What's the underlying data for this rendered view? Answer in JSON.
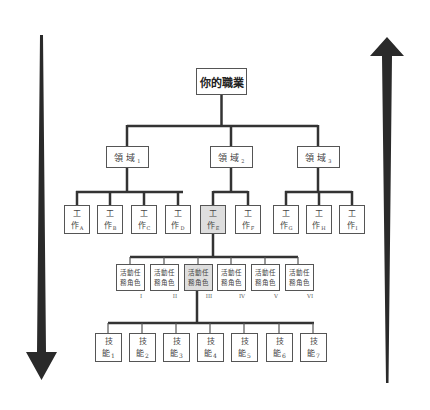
{
  "diagram": {
    "root": {
      "label": "你的職業"
    },
    "domains": [
      {
        "label": "領 域",
        "sub": "1"
      },
      {
        "label": "領 域",
        "sub": "2"
      },
      {
        "label": "領 域",
        "sub": "3"
      }
    ],
    "jobs": [
      {
        "line1": "工",
        "line2": "作",
        "sub": "A",
        "highlighted": false
      },
      {
        "line1": "工",
        "line2": "作",
        "sub": "B",
        "highlighted": false
      },
      {
        "line1": "工",
        "line2": "作",
        "sub": "C",
        "highlighted": false
      },
      {
        "line1": "工",
        "line2": "作",
        "sub": "D",
        "highlighted": false
      },
      {
        "line1": "工",
        "line2": "作",
        "sub": "E",
        "highlighted": true
      },
      {
        "line1": "工",
        "line2": "作",
        "sub": "F",
        "highlighted": false
      },
      {
        "line1": "工",
        "line2": "作",
        "sub": "G",
        "highlighted": false
      },
      {
        "line1": "工",
        "line2": "作",
        "sub": "H",
        "highlighted": false
      },
      {
        "line1": "工",
        "line2": "作",
        "sub": "I",
        "highlighted": false
      }
    ],
    "roles": [
      {
        "line1": "活動任",
        "line2": "務角色",
        "numeral": "I",
        "highlighted": false
      },
      {
        "line1": "活動任",
        "line2": "務角色",
        "numeral": "II",
        "highlighted": false
      },
      {
        "line1": "活動任",
        "line2": "務角色",
        "numeral": "III",
        "highlighted": true
      },
      {
        "line1": "活動任",
        "line2": "務角色",
        "numeral": "IV",
        "highlighted": false
      },
      {
        "line1": "活動任",
        "line2": "務角色",
        "numeral": "V",
        "highlighted": false
      },
      {
        "line1": "活動任",
        "line2": "務角色",
        "numeral": "VI",
        "highlighted": false
      }
    ],
    "skills": [
      {
        "line1": "技",
        "line2": "能",
        "sub": "1"
      },
      {
        "line1": "技",
        "line2": "能",
        "sub": "2"
      },
      {
        "line1": "技",
        "line2": "能",
        "sub": "3"
      },
      {
        "line1": "技",
        "line2": "能",
        "sub": "4"
      },
      {
        "line1": "技",
        "line2": "能",
        "sub": "5"
      },
      {
        "line1": "技",
        "line2": "能",
        "sub": "6"
      },
      {
        "line1": "技",
        "line2": "能",
        "sub": "7"
      }
    ],
    "arrows": {
      "left": {
        "direction": "down"
      },
      "right": {
        "direction": "up"
      }
    },
    "colors": {
      "line": "#333333",
      "box_border": "#555555",
      "highlight_fill": "#dedede",
      "arrow": "#2a2a2a"
    }
  }
}
